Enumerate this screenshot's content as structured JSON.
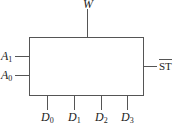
{
  "diagram": {
    "type": "block-diagram",
    "block": {
      "name": "multiplexer",
      "label": ""
    },
    "top_output": {
      "symbol": "W",
      "subscript": ""
    },
    "left_inputs": [
      {
        "symbol": "A",
        "subscript": "1"
      },
      {
        "symbol": "A",
        "subscript": "0"
      }
    ],
    "right_input": {
      "symbol": "ST",
      "overline": true
    },
    "bottom_inputs": [
      {
        "symbol": "D",
        "subscript": "0"
      },
      {
        "symbol": "D",
        "subscript": "1"
      },
      {
        "symbol": "D",
        "subscript": "2"
      },
      {
        "symbol": "D",
        "subscript": "3"
      }
    ]
  }
}
